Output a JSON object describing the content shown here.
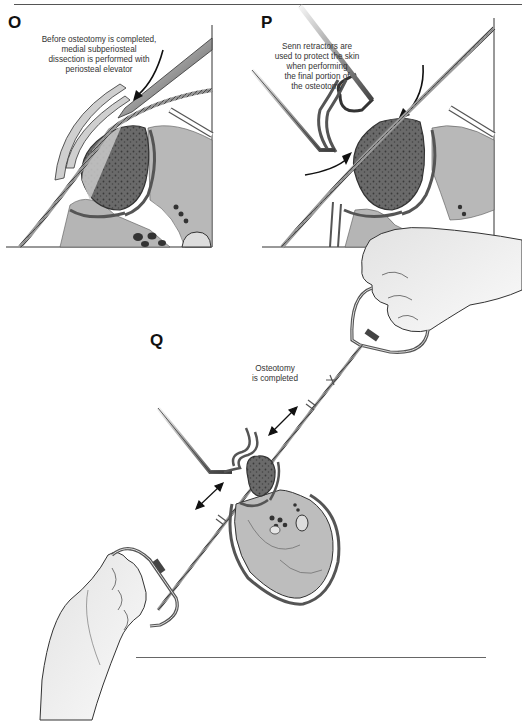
{
  "figure": {
    "header_rule": true,
    "panels": [
      {
        "id": "O",
        "label": "O",
        "caption": "Before osteotomy is completed,\nmedial subperiosteal\ndissection is performed with\nperiosteal elevator"
      },
      {
        "id": "P",
        "label": "P",
        "caption": "Senn retractors are\nused to protect the skin\nwhen performing\nthe final portion of\nthe osteotomy"
      },
      {
        "id": "Q",
        "label": "Q",
        "caption": "Osteotomy\nis completed"
      }
    ],
    "colors": {
      "line": "#333333",
      "muscle": "#b8b8b8",
      "bone_cortex": "#5a5a5a",
      "marrow": "#6e6e6e",
      "skin_fill": "#eeeeee",
      "background": "#ffffff"
    },
    "icons": {
      "arrow": "curved-arrow",
      "double_arrow": "bidirectional-arrow",
      "saw": "gigli-saw",
      "retractor": "senn-retractor",
      "elevator": "periosteal-elevator",
      "hand": "hand"
    }
  }
}
